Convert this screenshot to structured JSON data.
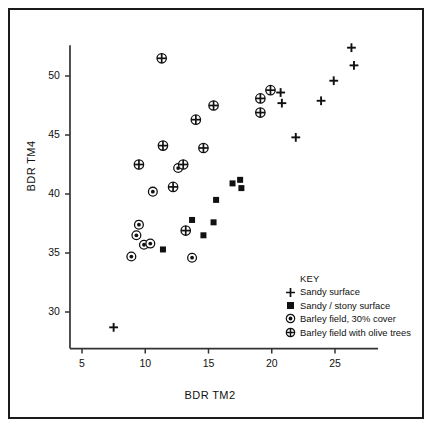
{
  "figure": {
    "background": "#ffffff",
    "border_color": "#1a1a1a",
    "marker_color": "#111111"
  },
  "axes": {
    "x_title": "BDR TM2",
    "y_title": "BDR TM4",
    "x_ticks": [
      "5",
      "10",
      "15",
      "20",
      "25"
    ],
    "y_ticks": [
      "30",
      "35",
      "40",
      "45",
      "50"
    ]
  },
  "legend": {
    "title": "KEY",
    "entries": [
      {
        "symbol": "plus-marker",
        "label": "Sandy surface"
      },
      {
        "symbol": "filled-square-marker",
        "label": "Sandy / stony surface"
      },
      {
        "symbol": "circled-dot-marker",
        "label": "Barley field, 30% cover"
      },
      {
        "symbol": "circled-plus-marker",
        "label": "Barley field with olive trees"
      }
    ]
  },
  "chart_data": {
    "type": "scatter",
    "title": "",
    "xlabel": "BDR TM2",
    "ylabel": "BDR TM4",
    "xlim": [
      4.0,
      28.5
    ],
    "ylim": [
      26.5,
      52.8
    ],
    "xticks": [
      5,
      10,
      15,
      20,
      25
    ],
    "yticks": [
      30,
      35,
      40,
      45,
      50
    ],
    "grid": false,
    "legend_position": "lower-right-inside",
    "series": [
      {
        "name": "Sandy surface",
        "marker": "plus",
        "points": [
          [
            7.5,
            28.7
          ],
          [
            20.7,
            48.6
          ],
          [
            20.8,
            47.7
          ],
          [
            21.9,
            44.8
          ],
          [
            23.9,
            47.9
          ],
          [
            24.9,
            49.6
          ],
          [
            26.3,
            52.4
          ],
          [
            26.5,
            50.9
          ]
        ]
      },
      {
        "name": "Sandy / stony surface",
        "marker": "filled-square",
        "points": [
          [
            11.4,
            35.3
          ],
          [
            13.7,
            37.8
          ],
          [
            14.6,
            36.5
          ],
          [
            15.4,
            37.6
          ],
          [
            15.6,
            39.5
          ],
          [
            16.9,
            40.9
          ],
          [
            17.5,
            41.2
          ],
          [
            17.6,
            40.5
          ]
        ]
      },
      {
        "name": "Barley field, 30% cover",
        "marker": "circled-dot",
        "points": [
          [
            8.9,
            34.7
          ],
          [
            9.3,
            36.5
          ],
          [
            9.5,
            37.4
          ],
          [
            9.9,
            35.7
          ],
          [
            10.4,
            35.8
          ],
          [
            10.6,
            40.2
          ],
          [
            12.6,
            42.2
          ],
          [
            13.7,
            34.6
          ]
        ]
      },
      {
        "name": "Barley field with olive trees",
        "marker": "circled-plus",
        "points": [
          [
            9.5,
            42.5
          ],
          [
            11.3,
            51.5
          ],
          [
            11.4,
            44.1
          ],
          [
            12.2,
            40.6
          ],
          [
            13.0,
            42.5
          ],
          [
            13.2,
            36.9
          ],
          [
            14.0,
            46.3
          ],
          [
            14.6,
            43.9
          ],
          [
            15.4,
            47.5
          ],
          [
            19.1,
            48.1
          ],
          [
            19.1,
            46.9
          ],
          [
            19.9,
            48.8
          ]
        ]
      }
    ]
  }
}
